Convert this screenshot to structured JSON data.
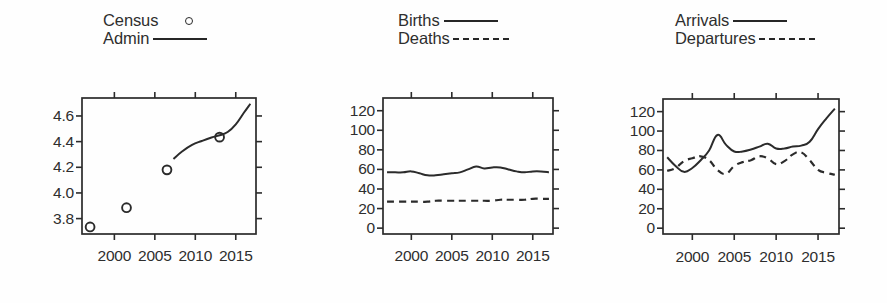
{
  "figure": {
    "background": "#fefefe",
    "ink": "#2b2b2b",
    "panel_count": 3
  },
  "chart_data": [
    {
      "id": "panel-1",
      "type": "line",
      "title": "",
      "xlabel": "",
      "ylabel": "",
      "grid": false,
      "legend_position": "top",
      "xlim": [
        1996,
        2017.5
      ],
      "ylim": [
        3.68,
        4.74
      ],
      "xticks": [
        2000,
        2005,
        2010,
        2015
      ],
      "xticklabels": [
        "2000",
        "2005",
        "2010",
        "2015"
      ],
      "yticks": [
        3.8,
        4.0,
        4.2,
        4.4,
        4.6
      ],
      "yticklabels": [
        "3.8",
        "4.0",
        "4.2",
        "4.4",
        "4.6"
      ],
      "legend": [
        {
          "name": "Census",
          "marker": "circle",
          "line": "none"
        },
        {
          "name": "Admin",
          "marker": "none",
          "line": "solid"
        }
      ],
      "series": [
        {
          "name": "Census",
          "style": "scatter-circle",
          "x": [
            1997.0,
            2001.5,
            2006.5,
            2013.0
          ],
          "y": [
            3.735,
            3.885,
            4.18,
            4.435
          ]
        },
        {
          "name": "Admin",
          "style": "solid",
          "x": [
            2007.3,
            2008.4,
            2009.6,
            2010.8,
            2012.0,
            2013.0,
            2014.0,
            2015.0,
            2016.0,
            2016.8
          ],
          "y": [
            4.265,
            4.325,
            4.375,
            4.405,
            4.432,
            4.45,
            4.475,
            4.535,
            4.625,
            4.695
          ]
        }
      ]
    },
    {
      "id": "panel-2",
      "type": "line",
      "title": "",
      "xlabel": "",
      "ylabel": "",
      "grid": false,
      "legend_position": "top",
      "xlim": [
        1996.5,
        2017.5
      ],
      "ylim": [
        -6,
        133
      ],
      "xticks": [
        2000,
        2005,
        2010,
        2015
      ],
      "xticklabels": [
        "2000",
        "2005",
        "2010",
        "2015"
      ],
      "yticks": [
        0,
        20,
        40,
        60,
        80,
        100,
        120
      ],
      "yticklabels": [
        "0",
        "20",
        "40",
        "60",
        "80",
        "100",
        "120"
      ],
      "legend": [
        {
          "name": "Births",
          "marker": "none",
          "line": "solid"
        },
        {
          "name": "Deaths",
          "marker": "none",
          "line": "dashed"
        }
      ],
      "series": [
        {
          "name": "Births",
          "style": "solid",
          "x": [
            1997,
            1998,
            1999,
            2000,
            2001,
            2002,
            2003,
            2004,
            2005,
            2006,
            2007,
            2008,
            2009,
            2010,
            2011,
            2012,
            2013,
            2014,
            2015,
            2016,
            2017
          ],
          "y": [
            57,
            57,
            57,
            58,
            56,
            54,
            54,
            55,
            56,
            57,
            60,
            63,
            61,
            62,
            62,
            60,
            58,
            57,
            58,
            58,
            57
          ]
        },
        {
          "name": "Deaths",
          "style": "dashed",
          "x": [
            1997,
            1998,
            1999,
            2000,
            2001,
            2002,
            2003,
            2004,
            2005,
            2006,
            2007,
            2008,
            2009,
            2010,
            2011,
            2012,
            2013,
            2014,
            2015,
            2016,
            2017
          ],
          "y": [
            27,
            27,
            27,
            27,
            27,
            27,
            28,
            28,
            28,
            28,
            28,
            28,
            28,
            28,
            29,
            29,
            29,
            29,
            30,
            30,
            30
          ]
        }
      ]
    },
    {
      "id": "panel-3",
      "type": "line",
      "title": "",
      "xlabel": "",
      "ylabel": "",
      "grid": false,
      "legend_position": "top",
      "xlim": [
        1996.5,
        2017.5
      ],
      "ylim": [
        -6,
        133
      ],
      "xticks": [
        2000,
        2005,
        2010,
        2015
      ],
      "xticklabels": [
        "2000",
        "2005",
        "2010",
        "2015"
      ],
      "yticks": [
        0,
        20,
        40,
        60,
        80,
        100,
        120
      ],
      "yticklabels": [
        "0",
        "20",
        "40",
        "60",
        "80",
        "100",
        "120"
      ],
      "legend": [
        {
          "name": "Arrivals",
          "marker": "none",
          "line": "solid"
        },
        {
          "name": "Departures",
          "marker": "none",
          "line": "dashed"
        }
      ],
      "series": [
        {
          "name": "Arrivals",
          "style": "solid",
          "x": [
            1997,
            1998,
            1999,
            2000,
            2001,
            2002,
            2003,
            2004,
            2005,
            2006,
            2007,
            2008,
            2009,
            2010,
            2011,
            2012,
            2013,
            2014,
            2015,
            2016,
            2017
          ],
          "y": [
            73,
            64,
            58,
            62,
            70,
            80,
            96,
            86,
            79,
            79,
            81,
            84,
            87,
            82,
            82,
            84,
            85,
            89,
            102,
            113,
            123
          ]
        },
        {
          "name": "Departures",
          "style": "dashed",
          "x": [
            1997,
            1998,
            1999,
            2000,
            2001,
            2002,
            2003,
            2004,
            2005,
            2006,
            2007,
            2008,
            2009,
            2010,
            2011,
            2012,
            2013,
            2014,
            2015,
            2016,
            2017
          ],
          "y": [
            59,
            62,
            69,
            72,
            74,
            70,
            60,
            56,
            64,
            68,
            70,
            74,
            72,
            66,
            69,
            76,
            78,
            70,
            60,
            57,
            55
          ]
        }
      ]
    }
  ]
}
